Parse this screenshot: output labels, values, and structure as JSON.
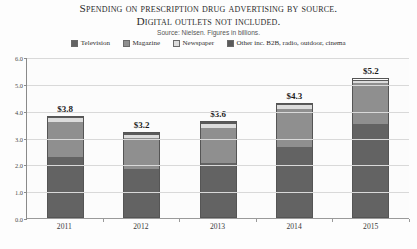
{
  "chart_data": {
    "type": "bar",
    "title": "Spending on prescription drug advertising by source.",
    "subtitle": "Digital outlets not included.",
    "source_note": "Source: Nielsen. Figures in billions.",
    "xlabel": "",
    "ylabel": "",
    "ylim": [
      0,
      6
    ],
    "ytick_labels": [
      "0.0",
      "1.0",
      "2.0",
      "3.0",
      "4.0",
      "5.0",
      "6.0"
    ],
    "ytick_values": [
      0,
      1,
      2,
      3,
      4,
      5,
      6
    ],
    "grid": true,
    "legend_position": "top",
    "stacked": true,
    "categories": [
      "2011",
      "2012",
      "2013",
      "2014",
      "2015"
    ],
    "totals": [
      3.8,
      3.2,
      3.6,
      4.3,
      5.2
    ],
    "total_labels": [
      "$3.8",
      "$3.2",
      "$3.6",
      "$4.3",
      "$5.2"
    ],
    "series": [
      {
        "name": "Television",
        "color": "#636363",
        "values": [
          2.3,
          1.85,
          2.05,
          2.65,
          3.5
        ]
      },
      {
        "name": "Magazine",
        "color": "#8f8f8f",
        "values": [
          1.3,
          1.15,
          1.35,
          1.45,
          1.55
        ]
      },
      {
        "name": "Newspaper",
        "color": "#dcdcdc",
        "values": [
          0.16,
          0.14,
          0.14,
          0.14,
          0.1
        ]
      },
      {
        "name": "Other inc. B2B, radio, outdoor, cinema",
        "color": "#5a5a5a",
        "values": [
          0.04,
          0.06,
          0.06,
          0.06,
          0.05
        ]
      }
    ]
  }
}
